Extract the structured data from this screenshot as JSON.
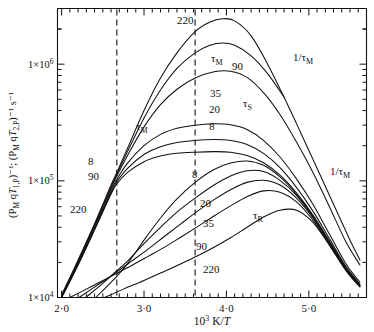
{
  "figure": {
    "name": "nmr-relaxation-arrhenius-plot",
    "background": "#ffffff",
    "line_color": "#111111",
    "dash_color": "#111111"
  },
  "axes": {
    "x": {
      "label_math": "10³ K/T",
      "label_prefix": "10",
      "label_sup": "3",
      "label_suffix_k": " K/",
      "label_suffix_t": "T",
      "min": 1.95,
      "max": 5.7,
      "major_ticks": [
        2.0,
        3.0,
        4.0,
        5.0
      ],
      "major_tick_labels": [
        "2·0",
        "3·0",
        "4·0",
        "5·0"
      ],
      "minor_tick_step": 0.1
    },
    "y": {
      "label_parts": {
        "p1": "(P",
        "p1sub": "M",
        "p2": " q",
        "p2it": "T",
        "p2sub": "1,P",
        "p2sup": ")⁻¹",
        "sep": "; (P",
        "p3sub": "M",
        "p4": " q",
        "p4it": "T",
        "p4sub": "2,P",
        "p4sup": ")⁻¹",
        "units": " s⁻¹"
      },
      "scale": "log",
      "min": 10000,
      "max": 3000000,
      "decade_labels": [
        {
          "value": 1000000,
          "text_prefix": "1×10",
          "text_sup": "6"
        },
        {
          "value": 100000,
          "text_prefix": "1×10",
          "text_sup": "5"
        },
        {
          "value": 10000,
          "text_prefix": "1×10",
          "text_sup": "4"
        }
      ]
    },
    "dashed_verticals": [
      2.67,
      3.62
    ]
  },
  "annotations": [
    {
      "id": "lbl-220-top",
      "text": "220",
      "x": 177,
      "y": 24,
      "size": 11
    },
    {
      "id": "lbl-tauM-peak",
      "text": "τ",
      "sub": "M",
      "x": 211,
      "y": 62,
      "size": 11
    },
    {
      "id": "lbl-90-upper",
      "text": "90",
      "x": 232,
      "y": 70,
      "size": 11
    },
    {
      "id": "lbl-invtauM-r",
      "text": "1/τ",
      "sub": "M",
      "x": 293,
      "y": 61,
      "size": 11
    },
    {
      "id": "lbl-35",
      "text": "35",
      "x": 210,
      "y": 97,
      "size": 11
    },
    {
      "id": "lbl-tauS",
      "text": "τ",
      "sub": "S",
      "x": 243,
      "y": 107,
      "size": 11
    },
    {
      "id": "lbl-20-mid",
      "text": "20",
      "x": 209,
      "y": 113,
      "size": 11
    },
    {
      "id": "lbl-8-mid",
      "text": "8",
      "x": 209,
      "y": 130,
      "size": 11
    },
    {
      "id": "lbl-tauM-left",
      "text": "τ",
      "sub": "M",
      "x": 136,
      "y": 130,
      "size": 11
    },
    {
      "id": "lbl-8-left",
      "text": "8",
      "x": 88,
      "y": 165,
      "size": 11
    },
    {
      "id": "lbl-90-left",
      "text": "90",
      "x": 88,
      "y": 180,
      "size": 11
    },
    {
      "id": "lbl-8-lower",
      "text": "8",
      "x": 192,
      "y": 178,
      "size": 11
    },
    {
      "id": "lbl-220-left",
      "text": "220",
      "x": 70,
      "y": 213,
      "size": 11
    },
    {
      "id": "lbl-20-lower",
      "text": "20",
      "x": 200,
      "y": 207,
      "size": 11
    },
    {
      "id": "lbl-35-lower",
      "text": "35",
      "x": 203,
      "y": 227,
      "size": 11
    },
    {
      "id": "lbl-tauR",
      "text": "τ",
      "sub": "R",
      "x": 253,
      "y": 219,
      "size": 11
    },
    {
      "id": "lbl-90-lower",
      "text": "90",
      "x": 196,
      "y": 250,
      "size": 11
    },
    {
      "id": "lbl-220-lower",
      "text": "220",
      "x": 203,
      "y": 273,
      "size": 11
    },
    {
      "id": "lbl-invtauM-b",
      "text": "1/τ",
      "sub": "M",
      "x": 330,
      "y": 175,
      "size": 11
    }
  ],
  "chart_data": {
    "type": "line",
    "title": "",
    "xlabel": "10^3 K/T",
    "ylabel": "(P_M qT_1,P)^-1; (P_M qT_2,P)^-1 s^-1",
    "xlim": [
      1.95,
      5.7
    ],
    "ylim": [
      10000,
      3000000
    ],
    "yscale": "log",
    "grid": false,
    "legend": "inline-curve-labels",
    "dashed_verticals": [
      2.67,
      3.62
    ],
    "series": [
      {
        "name": "1/tau_M envelope (220, T1P)",
        "label": "220",
        "group": "T1P",
        "points": [
          [
            2.0,
            10500
          ],
          [
            2.2,
            21000
          ],
          [
            2.4,
            43000
          ],
          [
            2.6,
            92000
          ],
          [
            2.67,
            118000
          ],
          [
            2.8,
            190000
          ],
          [
            3.0,
            400000
          ],
          [
            3.2,
            760000
          ],
          [
            3.4,
            1250000
          ],
          [
            3.62,
            1900000
          ],
          [
            3.8,
            2300000
          ],
          [
            3.95,
            2450000
          ],
          [
            4.1,
            2350000
          ],
          [
            4.3,
            1750000
          ],
          [
            4.5,
            1000000
          ],
          [
            4.7,
            520000
          ],
          [
            4.9,
            260000
          ],
          [
            5.1,
            128000
          ],
          [
            5.3,
            63000
          ],
          [
            5.5,
            31000
          ],
          [
            5.62,
            21000
          ]
        ]
      },
      {
        "name": "90 MHz (T1P)",
        "label": "90",
        "group": "T1P",
        "points": [
          [
            2.0,
            10200
          ],
          [
            2.2,
            20000
          ],
          [
            2.4,
            41000
          ],
          [
            2.6,
            86000
          ],
          [
            2.67,
            110000
          ],
          [
            2.8,
            165000
          ],
          [
            3.0,
            290000
          ],
          [
            3.2,
            450000
          ],
          [
            3.4,
            610000
          ],
          [
            3.62,
            760000
          ],
          [
            3.85,
            860000
          ],
          [
            4.05,
            870000
          ],
          [
            4.25,
            770000
          ],
          [
            4.45,
            570000
          ],
          [
            4.65,
            370000
          ],
          [
            4.85,
            215000
          ],
          [
            5.05,
            118000
          ],
          [
            5.25,
            60000
          ],
          [
            5.45,
            30000
          ],
          [
            5.62,
            19000
          ]
        ]
      },
      {
        "name": "35 MHz (T1P)",
        "label": "35",
        "group": "T1P",
        "points": [
          [
            2.0,
            10100
          ],
          [
            2.2,
            19500
          ],
          [
            2.4,
            39500
          ],
          [
            2.6,
            82000
          ],
          [
            2.67,
            103000
          ],
          [
            2.8,
            142000
          ],
          [
            3.0,
            200000
          ],
          [
            3.2,
            250000
          ],
          [
            3.4,
            282000
          ],
          [
            3.62,
            300000
          ],
          [
            3.85,
            308000
          ],
          [
            4.05,
            302000
          ],
          [
            4.25,
            275000
          ],
          [
            4.45,
            222000
          ],
          [
            4.65,
            160000
          ],
          [
            4.85,
            104000
          ],
          [
            5.05,
            63000
          ],
          [
            5.25,
            35000
          ],
          [
            5.45,
            19500
          ],
          [
            5.62,
            13500
          ]
        ]
      },
      {
        "name": "20 MHz (T1P)",
        "label": "20",
        "group": "T1P",
        "points": [
          [
            2.0,
            10000
          ],
          [
            2.2,
            19200
          ],
          [
            2.4,
            38500
          ],
          [
            2.6,
            79000
          ],
          [
            2.67,
            98000
          ],
          [
            2.8,
            128000
          ],
          [
            3.0,
            168000
          ],
          [
            3.2,
            196000
          ],
          [
            3.4,
            213000
          ],
          [
            3.62,
            222000
          ],
          [
            3.85,
            226000
          ],
          [
            4.05,
            222000
          ],
          [
            4.25,
            205000
          ],
          [
            4.45,
            172000
          ],
          [
            4.65,
            130000
          ],
          [
            4.85,
            88000
          ],
          [
            5.05,
            55000
          ],
          [
            5.25,
            32000
          ],
          [
            5.45,
            18500
          ],
          [
            5.62,
            13000
          ]
        ]
      },
      {
        "name": "8 MHz (T1P)",
        "label": "8",
        "group": "T1P",
        "points": [
          [
            2.0,
            9900
          ],
          [
            2.2,
            19000
          ],
          [
            2.4,
            38000
          ],
          [
            2.6,
            77000
          ],
          [
            2.67,
            94000
          ],
          [
            2.8,
            118000
          ],
          [
            3.0,
            146000
          ],
          [
            3.2,
            163000
          ],
          [
            3.4,
            172000
          ],
          [
            3.62,
            176000
          ],
          [
            3.85,
            178000
          ],
          [
            4.05,
            176000
          ],
          [
            4.25,
            165000
          ],
          [
            4.45,
            143000
          ],
          [
            4.65,
            112000
          ],
          [
            4.85,
            79000
          ],
          [
            5.05,
            51000
          ],
          [
            5.25,
            30500
          ],
          [
            5.45,
            18000
          ],
          [
            5.62,
            12800
          ]
        ]
      },
      {
        "name": "8 MHz (T2P)",
        "label": "8",
        "group": "T2P",
        "points": [
          [
            2.42,
            10100
          ],
          [
            2.6,
            13500
          ],
          [
            2.67,
            15200
          ],
          [
            2.8,
            19500
          ],
          [
            3.0,
            31000
          ],
          [
            3.2,
            48000
          ],
          [
            3.4,
            70000
          ],
          [
            3.62,
            97000
          ],
          [
            3.85,
            125000
          ],
          [
            4.05,
            142000
          ],
          [
            4.25,
            148000
          ],
          [
            4.45,
            136000
          ],
          [
            4.65,
            108000
          ],
          [
            4.85,
            77000
          ],
          [
            5.05,
            50000
          ],
          [
            5.25,
            30000
          ],
          [
            5.45,
            17800
          ],
          [
            5.62,
            12700
          ]
        ]
      },
      {
        "name": "20 MHz (T2P)",
        "label": "20",
        "group": "T2P",
        "points": [
          [
            2.3,
            10100
          ],
          [
            2.5,
            13200
          ],
          [
            2.67,
            17000
          ],
          [
            2.8,
            20500
          ],
          [
            3.0,
            29000
          ],
          [
            3.2,
            40000
          ],
          [
            3.4,
            54000
          ],
          [
            3.62,
            71000
          ],
          [
            3.85,
            92000
          ],
          [
            4.05,
            110000
          ],
          [
            4.25,
            122000
          ],
          [
            4.45,
            120000
          ],
          [
            4.65,
            101000
          ],
          [
            4.85,
            75000
          ],
          [
            5.05,
            49000
          ],
          [
            5.25,
            29500
          ],
          [
            5.45,
            17600
          ],
          [
            5.62,
            12600
          ]
        ]
      },
      {
        "name": "35 MHz (T2P)",
        "label": "35",
        "group": "T2P",
        "points": [
          [
            2.22,
            10100
          ],
          [
            2.45,
            13000
          ],
          [
            2.67,
            16600
          ],
          [
            2.85,
            20500
          ],
          [
            3.05,
            26000
          ],
          [
            3.25,
            33500
          ],
          [
            3.45,
            43000
          ],
          [
            3.65,
            55000
          ],
          [
            3.85,
            69000
          ],
          [
            4.05,
            84000
          ],
          [
            4.25,
            97000
          ],
          [
            4.45,
            101000
          ],
          [
            4.65,
            92000
          ],
          [
            4.85,
            71000
          ],
          [
            5.05,
            48000
          ],
          [
            5.25,
            29000
          ],
          [
            5.45,
            17400
          ],
          [
            5.62,
            12500
          ]
        ]
      },
      {
        "name": "90 MHz (T2P)",
        "label": "90",
        "group": "T2P",
        "points": [
          [
            2.1,
            10000
          ],
          [
            2.35,
            12300
          ],
          [
            2.6,
            15200
          ],
          [
            2.85,
            18800
          ],
          [
            3.05,
            22500
          ],
          [
            3.25,
            27000
          ],
          [
            3.45,
            33000
          ],
          [
            3.65,
            40500
          ],
          [
            3.85,
            50000
          ],
          [
            4.05,
            61000
          ],
          [
            4.25,
            73000
          ],
          [
            4.45,
            82000
          ],
          [
            4.65,
            80000
          ],
          [
            4.85,
            66000
          ],
          [
            5.05,
            46000
          ],
          [
            5.25,
            28500
          ],
          [
            5.45,
            17200
          ],
          [
            5.62,
            12400
          ]
        ]
      },
      {
        "name": "220 MHz (T2P)",
        "label": "220",
        "group": "T2P",
        "points": [
          [
            2.52,
            10000
          ],
          [
            2.75,
            11800
          ],
          [
            3.0,
            14000
          ],
          [
            3.25,
            16800
          ],
          [
            3.45,
            19500
          ],
          [
            3.65,
            22800
          ],
          [
            3.85,
            27000
          ],
          [
            4.05,
            32500
          ],
          [
            4.25,
            40000
          ],
          [
            4.45,
            49000
          ],
          [
            4.65,
            56000
          ],
          [
            4.85,
            56000
          ],
          [
            5.05,
            44000
          ],
          [
            5.25,
            28000
          ],
          [
            5.45,
            17000
          ],
          [
            5.62,
            12300
          ]
        ]
      },
      {
        "name": "1/tau_M low branch (left rise)",
        "label": "1/τ_M left",
        "group": "tauM",
        "points": [
          [
            2.0,
            10400
          ],
          [
            2.2,
            20500
          ],
          [
            2.4,
            42000
          ],
          [
            2.6,
            89000
          ],
          [
            2.67,
            114000
          ],
          [
            2.8,
            178000
          ],
          [
            3.0,
            345000
          ],
          [
            3.2,
            600000
          ],
          [
            3.4,
            920000
          ],
          [
            3.62,
            1250000
          ],
          [
            3.8,
            1450000
          ],
          [
            3.95,
            1520000
          ],
          [
            4.1,
            1450000
          ],
          [
            4.3,
            1180000
          ],
          [
            4.5,
            830000
          ],
          [
            4.7,
            520000
          ]
        ]
      }
    ]
  }
}
